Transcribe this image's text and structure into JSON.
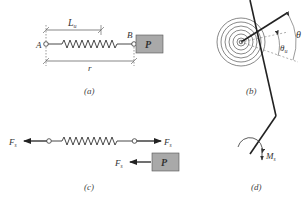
{
  "panels": {
    "a": {
      "caption": "(a)",
      "point_a": "A",
      "point_b": "B",
      "length_label": "L",
      "length_sub": "u",
      "distance_label": "r",
      "block_label": "P"
    },
    "b": {
      "caption": "(b)",
      "angle_label": "θ",
      "angle_u_label": "θ",
      "angle_u_sub": "u"
    },
    "c": {
      "caption": "(c)",
      "force_left": "F",
      "force_left_sub": "s",
      "force_right": "F",
      "force_right_sub": "s",
      "force_block": "F",
      "force_block_sub": "s",
      "block_label": "P"
    },
    "d": {
      "caption": "(d)",
      "moment_label": "M",
      "moment_sub": "s"
    }
  },
  "colors": {
    "line": "#333333",
    "block_fill": "#a9a9a9",
    "block_stroke": "#555555"
  }
}
